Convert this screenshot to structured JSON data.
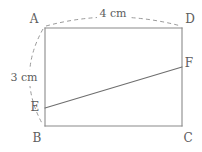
{
  "figure": {
    "type": "rectangle-with-segment",
    "vertices": [
      {
        "name": "A",
        "label": "A",
        "x": 45,
        "y": 28,
        "label_x": 34,
        "label_y": 19
      },
      {
        "name": "D",
        "label": "D",
        "x": 182,
        "y": 28,
        "label_x": 190,
        "label_y": 19
      },
      {
        "name": "B",
        "label": "B",
        "x": 45,
        "y": 126,
        "label_x": 37,
        "label_y": 138
      },
      {
        "name": "C",
        "label": "C",
        "x": 182,
        "y": 126,
        "label_x": 188,
        "label_y": 138
      },
      {
        "name": "E",
        "label": "E",
        "x": 45,
        "y": 108,
        "label_x": 35,
        "label_y": 107
      },
      {
        "name": "F",
        "label": "F",
        "x": 182,
        "y": 67,
        "label_x": 189,
        "label_y": 63
      }
    ],
    "edges": [
      {
        "name": "side-AD",
        "from": "A",
        "to": "D"
      },
      {
        "name": "side-DC",
        "from": "D",
        "to": "C"
      },
      {
        "name": "side-CB",
        "from": "C",
        "to": "B"
      },
      {
        "name": "side-BA",
        "from": "B",
        "to": "A"
      }
    ],
    "segments": [
      {
        "name": "segment-EF",
        "from": "E",
        "to": "F",
        "style": "solid"
      }
    ],
    "dimensions": [
      {
        "name": "width-dimension",
        "value": "4 cm",
        "measures": "AD",
        "arc_path": "M 46 26 Q 113 8 181 26",
        "label_x": 113,
        "label_y": 14,
        "orientation": "horizontal"
      },
      {
        "name": "height-dimension",
        "value": "3 cm",
        "measures": "AB",
        "arc_path": "M 43 29 Q 16 77 43 125",
        "label_x": 24,
        "label_y": 78,
        "orientation": "vertical"
      }
    ]
  },
  "colors": {
    "background": "#ffffff",
    "edge_stroke": "#8a8a8a",
    "diagonal_stroke": "#6e6e6e",
    "dashed_stroke": "#9a9a9a",
    "text": "#5d5d5d"
  }
}
